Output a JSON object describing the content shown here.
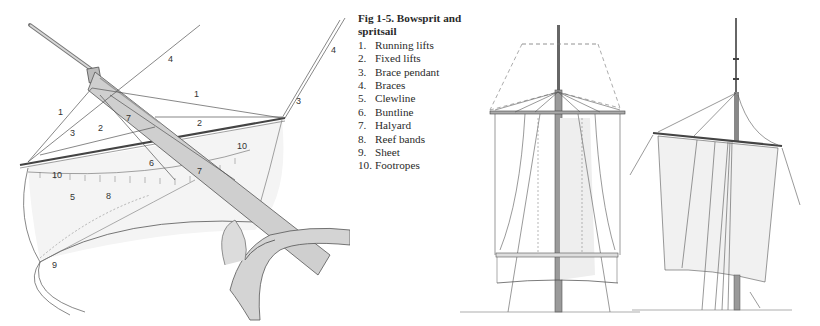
{
  "figure": {
    "title": "Fig 1-5. Bowsprit and spritsail",
    "legend": [
      {
        "number": "1.",
        "label": "Running lifts"
      },
      {
        "number": "2.",
        "label": "Fixed lifts"
      },
      {
        "number": "3.",
        "label": "Brace pendant"
      },
      {
        "number": "4.",
        "label": "Braces"
      },
      {
        "number": "5.",
        "label": "Clewline"
      },
      {
        "number": "6.",
        "label": "Buntline"
      },
      {
        "number": "7.",
        "label": "Halyard"
      },
      {
        "number": "8.",
        "label": "Reef bands"
      },
      {
        "number": "9.",
        "label": "Sheet"
      },
      {
        "number": "10.",
        "label": "Footropes"
      }
    ]
  },
  "drawing_labels": {
    "l1a": "1",
    "l1b": "1",
    "l2a": "2",
    "l2b": "2",
    "l3a": "3",
    "l3b": "3",
    "l4a": "4",
    "l4b": "4",
    "l5": "5",
    "l6": "6",
    "l7a": "7",
    "l7b": "7",
    "l8": "8",
    "l9": "9",
    "l10a": "10",
    "l10b": "10"
  },
  "colors": {
    "ink": "#3a3a3a",
    "wood": "#c9c9c9",
    "sail": "#f1f1f1"
  }
}
